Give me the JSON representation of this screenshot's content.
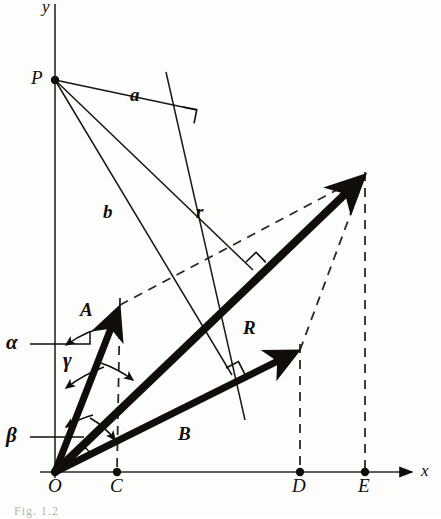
{
  "figure": {
    "kind": "vector-addition-geometric-diagram",
    "background_color": "#fdfdfb",
    "ink_color": "#100d0a"
  },
  "axes": {
    "x_label": "x",
    "y_label": "y",
    "origin_label": "O",
    "x_axis": {
      "y": 472,
      "x_start": 40,
      "x_end": 412
    },
    "y_axis": {
      "x": 55,
      "y_start": 4,
      "y_end": 478
    }
  },
  "points": [
    {
      "name": "O",
      "label": "O",
      "x": 55,
      "y": 472,
      "dot": true,
      "label_dx": -7,
      "label_dy": 10
    },
    {
      "name": "C",
      "label": "C",
      "x": 117,
      "y": 472,
      "dot": true,
      "label_dx": -6,
      "label_dy": 10
    },
    {
      "name": "D",
      "label": "D",
      "x": 300,
      "y": 472,
      "dot": true,
      "label_dx": -7,
      "label_dy": 10
    },
    {
      "name": "E",
      "label": "E",
      "x": 365,
      "y": 472,
      "dot": true,
      "label_dx": -6,
      "label_dy": 10
    },
    {
      "name": "P",
      "label": "P",
      "x": 55,
      "y": 80,
      "dot": true,
      "label_dx": -20,
      "label_dy": -5
    }
  ],
  "vectors": [
    {
      "name": "A",
      "label": "A",
      "x1": 55,
      "y1": 472,
      "x2": 120,
      "y2": 305,
      "label_x": 80,
      "label_y": 300,
      "width": 7
    },
    {
      "name": "B",
      "label": "B",
      "x1": 55,
      "y1": 472,
      "x2": 300,
      "y2": 350,
      "label_x": 178,
      "label_y": 424,
      "width": 7
    },
    {
      "name": "R",
      "label": "R",
      "x1": 55,
      "y1": 472,
      "x2": 365,
      "y2": 175,
      "label_x": 243,
      "label_y": 318,
      "width": 8
    }
  ],
  "segments_from_P": [
    {
      "name": "a",
      "label": "a",
      "x1": 55,
      "y1": 80,
      "x2": 197,
      "y2": 110,
      "label_x": 130,
      "label_y": 85
    },
    {
      "name": "b",
      "label": "b",
      "x1": 55,
      "y1": 80,
      "x2": 232,
      "y2": 375,
      "label_x": 103,
      "label_y": 202
    },
    {
      "name": "r",
      "label": "r",
      "x1": 55,
      "y1": 80,
      "x2": 253,
      "y2": 270,
      "label_x": 196,
      "label_y": 202
    }
  ],
  "construction_lines": [
    {
      "name": "perp-line-through-a",
      "x1": 166,
      "y1": 72,
      "x2": 245,
      "y2": 420
    }
  ],
  "right_angles": [
    {
      "name": "right-angle-a",
      "x": 183,
      "y": 107,
      "rot": 11
    },
    {
      "name": "right-angle-r-R",
      "x": 246,
      "y": 262,
      "rot": -44
    },
    {
      "name": "right-angle-b-B",
      "x": 226,
      "y": 368,
      "rot": -27
    }
  ],
  "dashed": {
    "parallelogram": [
      {
        "name": "dash-A-to-Rtip",
        "x1": 120,
        "y1": 305,
        "x2": 365,
        "y2": 175
      },
      {
        "name": "dash-B-to-Rtip",
        "x1": 300,
        "y1": 350,
        "x2": 365,
        "y2": 175
      }
    ],
    "drop_lines": [
      {
        "name": "drop-A-to-C",
        "x1": 120,
        "y1": 298,
        "x2": 117,
        "y2": 470
      },
      {
        "name": "drop-B-to-D",
        "x1": 300,
        "y1": 344,
        "x2": 300,
        "y2": 470
      },
      {
        "name": "drop-R-to-E",
        "x1": 365,
        "y1": 172,
        "x2": 365,
        "y2": 470
      }
    ]
  },
  "angles": [
    {
      "name": "alpha",
      "label": "α",
      "label_x": 6,
      "label_y": 332,
      "leader_x1": 30,
      "leader_y1": 344,
      "leader_x2": 55,
      "leader_y2": 344
    },
    {
      "name": "gamma",
      "label": "γ",
      "label_x": 63,
      "label_y": 350,
      "leader_x1": null,
      "leader_y1": null,
      "leader_x2": null,
      "leader_y2": null
    },
    {
      "name": "beta",
      "label": "β",
      "label_x": 6,
      "label_y": 425,
      "leader_x1": 30,
      "leader_y1": 437,
      "leader_x2": 55,
      "leader_y2": 437
    }
  ],
  "caption": "Fig. 1.2"
}
